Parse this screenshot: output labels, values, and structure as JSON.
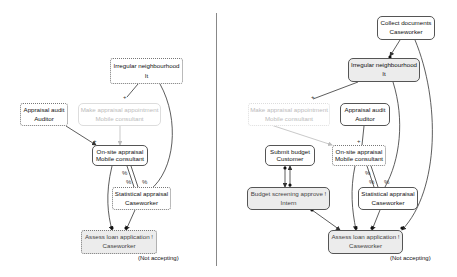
{
  "left_panel": {
    "nodes": {
      "irregular": {
        "title": "Irregular neighbourhood",
        "role": "It"
      },
      "audit": {
        "title": "Appraisal audit",
        "role": "Auditor"
      },
      "appointment": {
        "title": "Make appraisal appointment",
        "role": "Mobile consultant"
      },
      "onsite": {
        "title": "On-site appraisal",
        "role": "Mobile consultant"
      },
      "statistical": {
        "title": "Statistical appraisal",
        "role": "Caseworker"
      },
      "assess": {
        "title": "Assess loan application !",
        "role": "Caseworker"
      }
    },
    "note": "(Not accepting)",
    "edge_labels": {
      "plus1": "+",
      "plus2": "+",
      "pct1": "%",
      "pct2": "%",
      "pct3": "%"
    }
  },
  "right_panel": {
    "nodes": {
      "collect": {
        "title": "Collect documents",
        "role": "Caseworker"
      },
      "irregular": {
        "title": "Irregular neighbourhood",
        "role": "It"
      },
      "appointment": {
        "title": "Make appraisal appointment",
        "role": "Mobile consultant"
      },
      "audit": {
        "title": "Appraisal audit",
        "role": "Auditor"
      },
      "submit": {
        "title": "Submit budget",
        "role": "Customer"
      },
      "onsite": {
        "title": "On-site appraisal",
        "role": "Mobile consultant"
      },
      "budget": {
        "title": "Budget screening approve !",
        "role": "Intern"
      },
      "statistical": {
        "title": "Statistical appraisal",
        "role": "Caseworker"
      },
      "assess": {
        "title": "Assess loan application !",
        "role": "Caseworker"
      }
    },
    "note": "(Not accepting)",
    "edge_labels": {
      "plus1": "+",
      "plus2": "+",
      "pct1": "%",
      "pct2": "%",
      "pct3": "%"
    }
  },
  "colors": {
    "edge": "#333333",
    "faded": "#bbbbbb",
    "gray_fill": "#ececec"
  }
}
